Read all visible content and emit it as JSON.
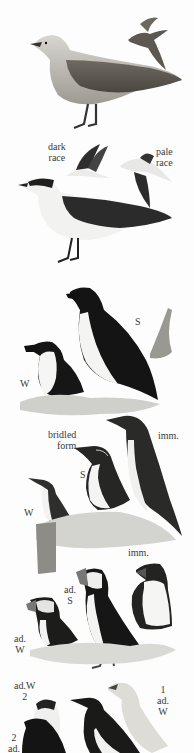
{
  "plate": {
    "background": "#fdfdfd",
    "ink_color": "#3a3a3a",
    "sections": [
      {
        "name": "long-tailed-skua",
        "labels": []
      },
      {
        "name": "arctic-skua",
        "labels": {
          "dark_race": [
            "dark",
            "race"
          ],
          "pale_race": [
            "pale",
            "race"
          ]
        }
      },
      {
        "name": "razorbill",
        "labels": {
          "summer": "S",
          "winter": "W"
        }
      },
      {
        "name": "guillemot",
        "labels": {
          "bridled": [
            "bridled",
            "form"
          ],
          "immature": "imm.",
          "summer": "S",
          "winter": "W"
        }
      },
      {
        "name": "puffin",
        "labels": {
          "immature": "imm.",
          "adult_summer": [
            "ad.",
            "S"
          ],
          "adult_winter": [
            "ad.",
            "W"
          ]
        }
      },
      {
        "name": "black-guillemot-and-little-auk",
        "labels": {
          "top_left": [
            "ad.W",
            "2"
          ],
          "bottom_left": [
            "2",
            "ad."
          ],
          "right": [
            "1",
            "ad.",
            "W"
          ]
        }
      }
    ]
  }
}
